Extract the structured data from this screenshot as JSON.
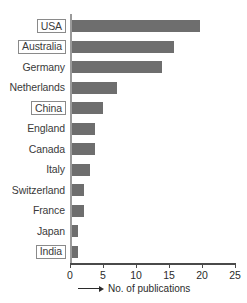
{
  "chart_data": {
    "type": "bar",
    "orientation": "horizontal",
    "title": "",
    "subtitle": "",
    "xlabel": "No. of publications",
    "ylabel": "",
    "xlim": [
      0,
      25
    ],
    "ylim": null,
    "grid": false,
    "legend": null,
    "x_ticks": [
      "0",
      "5",
      "10",
      "15",
      "20",
      "25"
    ],
    "x_tick_values": [
      0,
      5,
      10,
      15,
      20,
      25
    ],
    "bar_color": "#6e6e6e",
    "axis_color": "#4a4a4a",
    "categories": [
      "USA",
      "Australia",
      "Germany",
      "Netherlands",
      "China",
      "England",
      "Canada",
      "Italy",
      "Switzerland",
      "France",
      "Japan",
      "India"
    ],
    "values": [
      19.5,
      15.6,
      13.8,
      6.9,
      4.9,
      3.7,
      3.7,
      2.9,
      1.9,
      1.9,
      1.1,
      1.1
    ],
    "highlighted_categories": [
      "USA",
      "Australia",
      "China",
      "India"
    ],
    "bars": [
      {
        "label": "USA",
        "value": 19.5,
        "boxed": true
      },
      {
        "label": "Australia",
        "value": 15.6,
        "boxed": true
      },
      {
        "label": "Germany",
        "value": 13.8,
        "boxed": false
      },
      {
        "label": "Netherlands",
        "value": 6.9,
        "boxed": false
      },
      {
        "label": "China",
        "value": 4.9,
        "boxed": true
      },
      {
        "label": "England",
        "value": 3.7,
        "boxed": false
      },
      {
        "label": "Canada",
        "value": 3.7,
        "boxed": false
      },
      {
        "label": "Italy",
        "value": 2.9,
        "boxed": false
      },
      {
        "label": "Switzerland",
        "value": 1.9,
        "boxed": false
      },
      {
        "label": "France",
        "value": 1.9,
        "boxed": false
      },
      {
        "label": "Japan",
        "value": 1.1,
        "boxed": false
      },
      {
        "label": "India",
        "value": 1.1,
        "boxed": true
      }
    ]
  }
}
